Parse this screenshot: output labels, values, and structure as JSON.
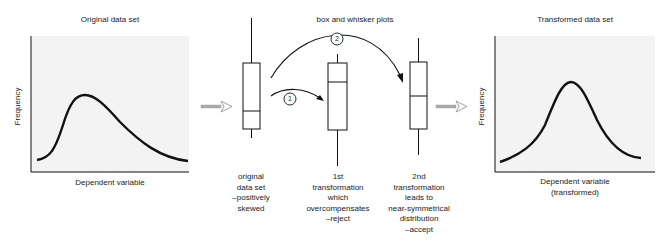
{
  "left_panel": {
    "title": "Original data set",
    "ylabel": "Frequency",
    "xlabel": "Dependent variable"
  },
  "middle": {
    "title": "box and whisker plots",
    "step1_label": "1",
    "step2_label": "2",
    "captions": [
      [
        "original",
        "data set",
        "–positively",
        "skewed"
      ],
      [
        "1st",
        "transformation",
        "which",
        "overcompensates",
        "–reject"
      ],
      [
        "2nd",
        "transformation",
        "leads to",
        "near-symmetrical",
        "distribution",
        "–accept"
      ]
    ]
  },
  "right_panel": {
    "title": "Transformed data set",
    "ylabel": "Frequency",
    "xlabel_line1": "Dependent variable",
    "xlabel_line2": "(transformed)"
  },
  "colors": {
    "panel_bg": "#f3f3f3",
    "line": "#111111",
    "arrow_fill": "#aaaaaa"
  }
}
